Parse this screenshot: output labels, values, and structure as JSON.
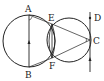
{
  "diagram": {
    "title": "",
    "points": {
      "A": {
        "label": "A",
        "x": 29,
        "y": 15
      },
      "B": {
        "label": "B",
        "x": 29,
        "y": 67
      },
      "C": {
        "label": "C",
        "x": 90,
        "y": 40
      },
      "D": {
        "label": "D",
        "x": 90,
        "y": 17
      },
      "E": {
        "label": "E",
        "x": 52,
        "y": 24
      },
      "F": {
        "label": "F",
        "x": 52,
        "y": 58
      }
    },
    "circles": [
      {
        "name": "left-circle",
        "cx": 29,
        "cy": 41,
        "r": 26
      },
      {
        "name": "right-circle",
        "cx": 69,
        "cy": 40,
        "r": 22
      }
    ],
    "segments": [
      "AB",
      "AE",
      "EC",
      "BF",
      "FC",
      "EF",
      "line-through-C-D"
    ],
    "stroke_color": "#222222"
  }
}
